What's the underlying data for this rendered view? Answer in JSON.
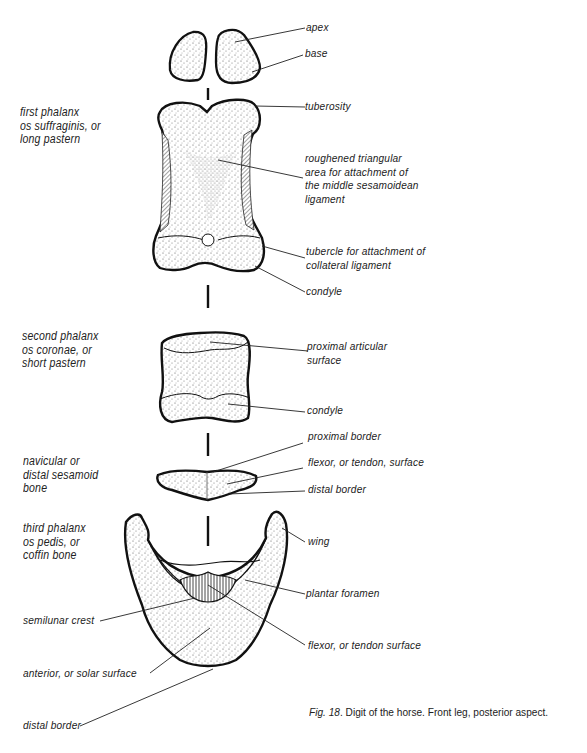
{
  "figure": {
    "number": "Fig. 18",
    "caption": "Digit of the horse. Front leg, posterior aspect."
  },
  "bones": [
    {
      "id": "proximal-sesamoids",
      "label": ""
    },
    {
      "id": "first-phalanx",
      "label": "first phalanx\nos suffraginis, or\nlong pastern"
    },
    {
      "id": "second-phalanx",
      "label": "second phalanx\nos coronae, or\nshort pastern"
    },
    {
      "id": "navicular",
      "label": "navicular or\ndistal sesamoid\nbone"
    },
    {
      "id": "third-phalanx",
      "label": "third phalanx\nos pedis, or\ncoffin bone"
    }
  ],
  "right_labels": [
    "apex",
    "base",
    "tuberosity",
    "roughened triangular\narea for attachment of\nthe middle sesamoidean\nligament",
    "tubercle for attachment of\ncollateral ligament",
    "condyle",
    "proximal articular\nsurface",
    "condyle",
    "proximal border",
    "flexor, or tendon, surface",
    "distal border",
    "wing",
    "plantar foramen",
    "flexor, or tendon surface"
  ],
  "left_bottom_labels": [
    "semilunar crest",
    "anterior, or solar surface",
    "distal border"
  ]
}
